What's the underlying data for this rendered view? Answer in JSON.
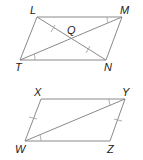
{
  "figures": [
    {
      "name": "parallelogram-LMNT",
      "vertices": {
        "L": {
          "label": "L",
          "x": 37,
          "y": 17
        },
        "M": {
          "label": "M",
          "x": 122,
          "y": 17
        },
        "N": {
          "label": "N",
          "x": 106,
          "y": 60
        },
        "T": {
          "label": "T",
          "x": 20,
          "y": 60
        },
        "Q": {
          "label": "Q",
          "x": 71,
          "y": 38
        }
      },
      "diagonals": [
        "LN",
        "MT"
      ],
      "congruence_marks": [
        "LQ ≅ QN (single tick)",
        "angle LMT ≅ angle MTN (arc)"
      ]
    },
    {
      "name": "parallelogram-WXYZ",
      "vertices": {
        "X": {
          "label": "X",
          "x": 41,
          "y": 99
        },
        "Y": {
          "label": "Y",
          "x": 125,
          "y": 99
        },
        "Z": {
          "label": "Z",
          "x": 110,
          "y": 141
        },
        "W": {
          "label": "W",
          "x": 25,
          "y": 141
        }
      },
      "diagonals": [
        "WY"
      ],
      "congruence_marks": [
        "WX ≅ YZ (single tick)",
        "angle XYW ≅ angle YWZ (arc)"
      ]
    }
  ],
  "labels": {
    "L": "L",
    "M": "M",
    "Q": "Q",
    "T": "T",
    "N": "N",
    "X": "X",
    "Y": "Y",
    "W": "W",
    "Z": "Z"
  }
}
